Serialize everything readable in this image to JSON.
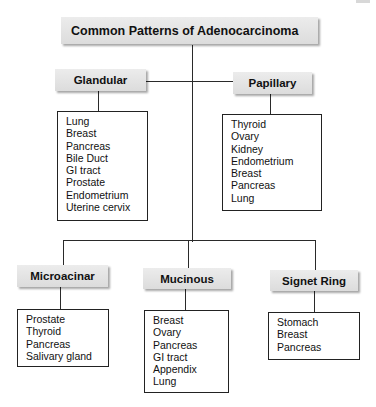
{
  "title": "Common Patterns of Adenocarcinoma",
  "patterns": [
    {
      "name": "Glandular",
      "sites": [
        "Lung",
        "Breast",
        "Pancreas",
        "Bile Duct",
        "GI tract",
        "Prostate",
        "Endometrium",
        "Uterine cervix"
      ]
    },
    {
      "name": "Papillary",
      "sites": [
        "Thyroid",
        "Ovary",
        "Kidney",
        "Endometrium",
        "Breast",
        "Pancreas",
        "Lung"
      ]
    },
    {
      "name": "Microacinar",
      "sites": [
        "Prostate",
        "Thyroid",
        "Pancreas",
        "Salivary gland"
      ]
    },
    {
      "name": "Mucinous",
      "sites": [
        "Breast",
        "Ovary",
        "Pancreas",
        "GI tract",
        "Appendix",
        "Lung"
      ]
    },
    {
      "name": "Signet Ring",
      "sites": [
        "Stomach",
        "Breast",
        "Pancreas"
      ]
    }
  ],
  "colors": {
    "header_fill": "#e3e3e3",
    "line": "#2a2a2a",
    "background": "#ffffff"
  }
}
